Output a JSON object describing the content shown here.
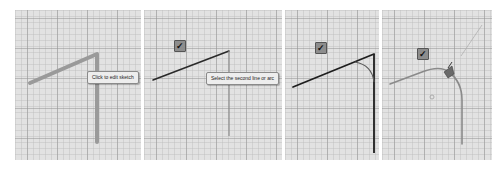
{
  "panels": [
    {
      "id": "step-1",
      "tooltip": "Click to edit sketch",
      "checkbox": null
    },
    {
      "id": "step-2",
      "tooltip": "Select the second line or arc",
      "checkbox": {
        "checked": true,
        "glyph": "✓"
      }
    },
    {
      "id": "step-3",
      "tooltip": null,
      "checkbox": {
        "checked": true,
        "glyph": "✓"
      }
    },
    {
      "id": "step-4",
      "tooltip": null,
      "checkbox": {
        "checked": true,
        "glyph": "✓"
      }
    }
  ],
  "colors": {
    "canvas_bg": "#e2e2e2",
    "highlight_line": "#9a9a9a",
    "sketch_line": "#2a2a2a",
    "fillet_line": "#7a7a7a",
    "checkbox_bg": "#8d8d8d"
  }
}
